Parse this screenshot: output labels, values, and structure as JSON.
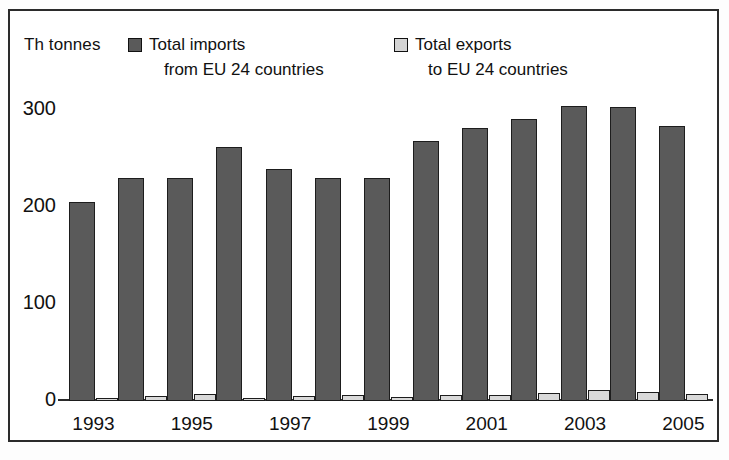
{
  "units_label": "Th tonnes",
  "legend": {
    "imports": {
      "line1": "Total imports",
      "line2": "from EU 24 countries",
      "color": "#5a5a5a"
    },
    "exports": {
      "line1": "Total exports",
      "line2": "to EU 24 countries",
      "color": "#d9d9d9"
    }
  },
  "axis": {
    "y_ticks": [
      "0",
      "100",
      "200",
      "300"
    ],
    "x_ticks": [
      "1993",
      "1995",
      "1997",
      "1999",
      "2001",
      "2003",
      "2005"
    ]
  },
  "chart_data": {
    "type": "bar",
    "title": "",
    "xlabel": "",
    "ylabel": "Th tonnes",
    "ylim": [
      0,
      320
    ],
    "yticks": [
      0,
      100,
      200,
      300
    ],
    "grid": false,
    "legend_position": "top",
    "categories": [
      "1993",
      "1994",
      "1995",
      "1996",
      "1997",
      "1998",
      "1999",
      "2000",
      "2001",
      "2002",
      "2003",
      "2004",
      "2005"
    ],
    "x_tick_labels": [
      "1993",
      "",
      "1995",
      "",
      "1997",
      "",
      "1999",
      "",
      "2001",
      "",
      "2003",
      "",
      "2005"
    ],
    "series": [
      {
        "name": "Total imports from EU 24 countries",
        "color": "#5a5a5a",
        "values": [
          205,
          230,
          230,
          262,
          240,
          230,
          230,
          268,
          282,
          291,
          305,
          303,
          284
        ]
      },
      {
        "name": "Total exports to EU 24 countries",
        "color": "#d9d9d9",
        "values": [
          3,
          5,
          7,
          3,
          5,
          6,
          4,
          6,
          6,
          8,
          11,
          9,
          7
        ]
      }
    ]
  }
}
